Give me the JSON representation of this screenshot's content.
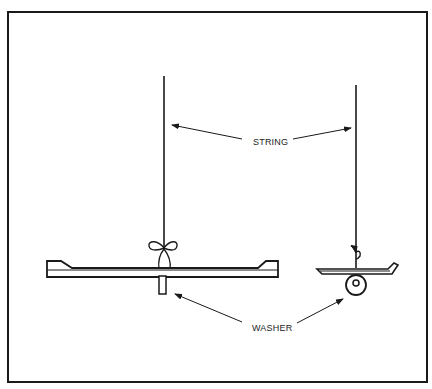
{
  "diagram": {
    "labels": {
      "string": "STRING",
      "washer": "WASHER"
    },
    "colors": {
      "line": "#1a1a1a",
      "background": "#ffffff"
    },
    "parts": {
      "left_view": "Front view: horizontal beam hung from string tied with a bow, washer slot below",
      "right_view": "Side view: beam end hung from string with washer ring below"
    }
  }
}
